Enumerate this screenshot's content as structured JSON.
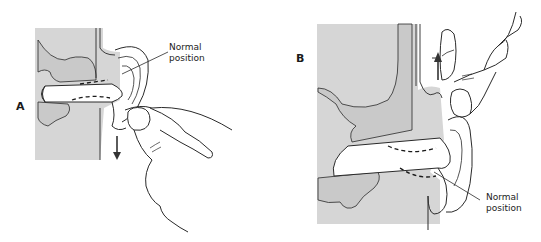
{
  "figure": {
    "type": "anatomical-diagram",
    "colors": {
      "tissue_fill": "#d6d6d6",
      "bone_fill": "#cfcfcf",
      "line": "#2a2a2a",
      "background": "#ffffff"
    }
  },
  "panels": [
    {
      "id": "A",
      "letter": "A",
      "callout_line1": "Normal",
      "callout_line2": "position",
      "arrow_direction": "down"
    },
    {
      "id": "B",
      "letter": "B",
      "callout_line1": "Normal",
      "callout_line2": "position",
      "arrow_direction": "up"
    }
  ]
}
